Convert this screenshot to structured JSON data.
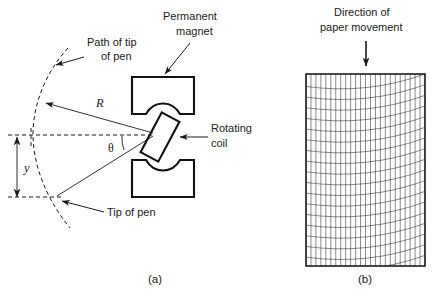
{
  "figure": {
    "title_visible": false,
    "background_color": "#ffffff",
    "ink_color": "#1a1a1a",
    "width": 436,
    "height": 300
  },
  "panel_a": {
    "caption": "(a)",
    "caption_x": 148,
    "caption_y": 283,
    "labels": {
      "path_of_tip_line1": "Path of tip",
      "path_of_tip_line2": "of pen",
      "permanent_magnet_line1": "Permanent",
      "permanent_magnet_line2": "magnet",
      "rotating_coil_line1": "Rotating",
      "rotating_coil_line2": "coil",
      "tip_of_pen": "Tip of pen",
      "radius_symbol": "R",
      "angle_symbol": "θ",
      "deflection_symbol": "y"
    },
    "geometry": {
      "pivot_x": 155,
      "pivot_y": 134,
      "arc_top_x": 61,
      "arc_top_y": 60,
      "arc_mid_x": 35,
      "arc_mid_y": 134,
      "arc_bottom_x": 62,
      "arc_bottom_y": 215,
      "tip_x": 55,
      "tip_y": 197,
      "upper_ray_end_x": 47,
      "upper_ray_end_y": 104,
      "y_arrow_x": 17,
      "y_arrow_top_y": 137,
      "y_arrow_bottom_y": 197,
      "theta_degrees": 30
    },
    "magnets": {
      "upper": {
        "x": 132,
        "y": 77,
        "width": 62,
        "height": 37
      },
      "lower": {
        "x": 132,
        "y": 160,
        "width": 62,
        "height": 37
      },
      "pole_gap_top_y": 114,
      "pole_gap_bottom_y": 160
    },
    "coil": {
      "center_x": 160,
      "center_y": 137,
      "width": 20,
      "height": 45,
      "rotation_degrees": 28
    }
  },
  "panel_b": {
    "caption": "(b)",
    "caption_x": 360,
    "caption_y": 283,
    "labels": {
      "direction_line1": "Direction of",
      "direction_line2": "paper movement"
    },
    "arrow": {
      "x": 366,
      "y_start": 40,
      "y_end": 66
    },
    "paper": {
      "left": 306,
      "top": 74,
      "right": 425,
      "bottom": 266,
      "vertical_line_count": 24,
      "horizontal_arc_count": 18,
      "arc_bulge_px": 16,
      "arc_direction": "concave-up"
    }
  }
}
